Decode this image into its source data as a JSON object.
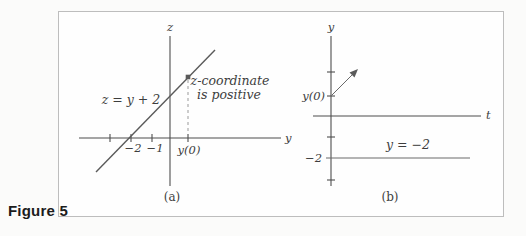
{
  "figure_label": "Figure 5",
  "panel_a": {
    "z_axis_label": "z",
    "y_axis_label": "y",
    "tick_minus2": "−2",
    "tick_minus1": "−1",
    "tick_y0": "y(0)",
    "equation_label": "z = y + 2",
    "annotation_line1": "z-coordinate",
    "annotation_line2": "is positive",
    "caption": "(a)"
  },
  "panel_b": {
    "y_axis_label": "y",
    "t_axis_label": "t",
    "y0_label": "y(0)",
    "tick_label_minus2": "−2",
    "solution_line_label": "y = −2",
    "caption": "(b)"
  },
  "colors": {
    "stroke": "#4d4d4d",
    "text": "#3d3d3d",
    "dashed_line": "#9a9a9a",
    "box_border": "#bdbdbd",
    "figure_label_color": "#1c1c1c",
    "background": "#fbfbfa"
  }
}
